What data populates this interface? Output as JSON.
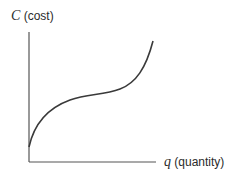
{
  "figure": {
    "y_axis": {
      "symbol": "C",
      "label": "(cost)"
    },
    "x_axis": {
      "symbol": "q",
      "label": "(quantity)"
    },
    "curve": {
      "description": "cubic-shaped total cost curve: concave then convex",
      "color": "#3a3a3a"
    },
    "axis_color": "#555555"
  }
}
